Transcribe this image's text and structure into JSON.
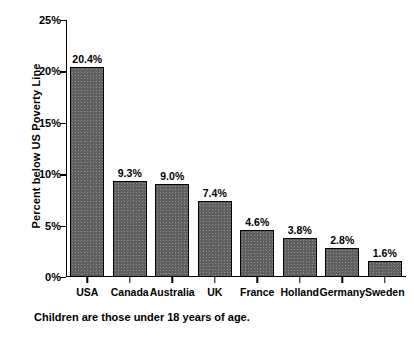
{
  "chart_data": {
    "type": "bar",
    "title": "",
    "subtitle": "",
    "xlabel": "",
    "ylabel": "Percent below US Poverty Line",
    "ylim": [
      0,
      25
    ],
    "grid": false,
    "legend": false,
    "categories": [
      "USA",
      "Canada",
      "Australia",
      "UK",
      "France",
      "Holland",
      "Germany",
      "Sweden"
    ],
    "values": [
      20.4,
      9.3,
      9.0,
      7.4,
      4.6,
      3.8,
      2.8,
      1.6
    ],
    "data_labels": [
      "20.4%",
      "9.3%",
      "9.0%",
      "7.4%",
      "4.6%",
      "3.8%",
      "2.8%",
      "1.6%"
    ],
    "y_ticks": [
      0,
      5,
      10,
      15,
      20,
      25
    ],
    "y_tick_labels": [
      "0%",
      "5%",
      "10%",
      "15%",
      "20%",
      "25%"
    ],
    "annotation": "Children are those under 18 years of age.",
    "colors": {
      "bar_fill": "#5f5f5f",
      "bar_border": "#000000",
      "axis": "#000000",
      "text": "#000000",
      "background": "#ffffff"
    }
  }
}
